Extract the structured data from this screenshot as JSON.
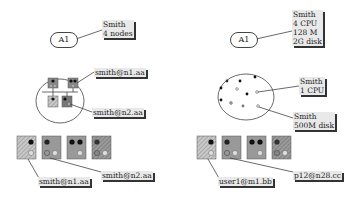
{
  "left_panel": {
    "top": {
      "pill": "A1",
      "label": [
        "Smith",
        "4 nodes"
      ]
    },
    "cluster": {
      "label_n1": "smith@n1.aa",
      "label_n2": "smith@n2.aa"
    },
    "bottom": {
      "label_a": "smith@n1.aa",
      "label_b": "smith@n2.aa"
    }
  },
  "right_panel": {
    "top": {
      "pill": "A1",
      "label": [
        "Smith",
        "4 CPU",
        "128 M",
        "2G disk"
      ]
    },
    "pool": {
      "label_cpu": [
        "Smith",
        "1 CPU"
      ],
      "label_disk": [
        "Smith",
        "500M disk"
      ]
    },
    "bottom": {
      "label_a": "user1@m1.bb",
      "label_b": "p12@n28.cc"
    }
  },
  "colors": {
    "stroke": "#444444",
    "label_bg": "#e9e9e9",
    "shadow": "#333333",
    "node_light": "#b8b8b8",
    "node_mid": "#8f8f8f",
    "node_dark": "#777777"
  }
}
